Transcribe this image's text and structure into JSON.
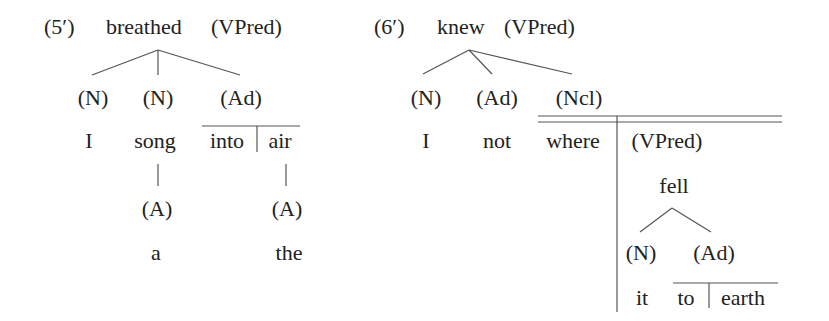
{
  "diagrams": [
    {
      "id": "5prime",
      "number": "(5′)",
      "root": {
        "word": "breathed",
        "category": "(VPred)"
      },
      "level1": [
        {
          "category": "(N)",
          "word": "I"
        },
        {
          "category": "(N)",
          "word": "song",
          "modifier": {
            "category": "(A)",
            "word": "a"
          }
        },
        {
          "category": "(Ad)",
          "phrase": {
            "preposition": "into",
            "object": "air"
          },
          "modifier": {
            "category": "(A)",
            "word": "the"
          }
        }
      ]
    },
    {
      "id": "6prime",
      "number": "(6′)",
      "root": {
        "word": "knew",
        "category": "(VPred)"
      },
      "level1": [
        {
          "category": "(N)",
          "word": "I"
        },
        {
          "category": "(Ad)",
          "word": "not"
        },
        {
          "category": "(Ncl)",
          "word": "where",
          "clause": {
            "category": "(VPred)",
            "verb": "fell",
            "children": [
              {
                "category": "(N)",
                "word": "it"
              },
              {
                "category": "(Ad)",
                "phrase": {
                  "preposition": "to",
                  "object": "earth"
                }
              }
            ]
          }
        }
      ]
    }
  ]
}
